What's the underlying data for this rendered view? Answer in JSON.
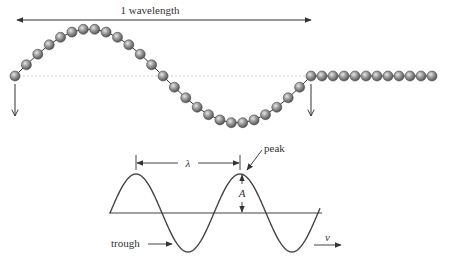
{
  "top_diagram": {
    "wavelength_label": "1 wavelength",
    "bead_color": "#8a8a8a",
    "bead_highlight": "#e0e0e0",
    "bead_outline": "#4a4a4a",
    "line_color": "#333333",
    "baseline_color": "#bbbbbb",
    "wave": {
      "x_start": 15,
      "x_end": 311,
      "y_center": 76,
      "amplitude": 47,
      "wave_bead_count": 26
    },
    "flat": {
      "x_start": 322,
      "x_end": 432,
      "bead_count": 11
    },
    "down_arrows": [
      {
        "x": 15,
        "y1": 84,
        "y2": 116
      },
      {
        "x": 311,
        "y1": 84,
        "y2": 116
      }
    ]
  },
  "bottom_diagram": {
    "lambda_label": "λ",
    "amplitude_label": "A",
    "peak_label": "peak",
    "trough_label": "trough",
    "velocity_label": "v",
    "line_color": "#444444"
  }
}
